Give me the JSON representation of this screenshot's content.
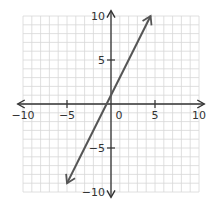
{
  "chart_data": {
    "type": "line",
    "title": "",
    "xlabel": "",
    "ylabel": "",
    "xlim": [
      -10,
      10
    ],
    "ylim": [
      -10,
      10
    ],
    "grid": true,
    "x_ticks": [
      -10,
      -5,
      0,
      5,
      10
    ],
    "y_ticks": [
      -10,
      -5,
      5,
      10
    ],
    "x_tick_labels": [
      "−10",
      "−5",
      "0",
      "5",
      "10"
    ],
    "y_tick_labels": [
      "−10",
      "−5",
      "5",
      "10"
    ],
    "series": [
      {
        "name": "y = 2x + 1",
        "equation": "y = 2x + 1",
        "slope": 2,
        "intercept": 1,
        "x": [
          -5,
          4.5
        ],
        "y": [
          -9,
          10
        ],
        "color": "#555555",
        "arrows_both_ends": true
      }
    ],
    "colors": {
      "grid": "#d8d8d8",
      "axis": "#333333",
      "line": "#555555"
    }
  }
}
